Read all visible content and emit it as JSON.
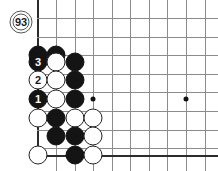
{
  "app": {
    "title": "Go Board Diagram",
    "board_type": "go-goban-corner-diagram"
  },
  "board": {
    "background_color": "#ffffff",
    "line_color": "#8c8c8c",
    "edge_color": "#2b2b2b",
    "black_color": "#141414",
    "white_color": "#ffffff",
    "cell_size": 18.6,
    "origin_x": 38,
    "origin_y": 18,
    "columns_x": [
      38,
      56,
      75,
      93,
      112,
      130,
      149,
      167,
      186,
      205
    ],
    "rows_y": [
      18,
      37,
      55,
      74,
      92,
      111,
      130,
      148
    ],
    "left_edge_x": 38,
    "bottom_edge_y": 155,
    "star_points": [
      {
        "name": "hoshi-left",
        "x": 93,
        "y": 99
      },
      {
        "name": "hoshi-right",
        "x": 186,
        "y": 99
      }
    ]
  },
  "move_marker": {
    "label": "93",
    "x": 21,
    "y": 22,
    "description": "move-number-marker"
  },
  "stones": [
    {
      "color": "black",
      "x": 38,
      "y": 55,
      "label": ""
    },
    {
      "color": "black",
      "x": 56,
      "y": 55,
      "label": ""
    },
    {
      "color": "black",
      "x": 38,
      "y": 62,
      "label": "3"
    },
    {
      "color": "white",
      "x": 56,
      "y": 62,
      "label": ""
    },
    {
      "color": "black",
      "x": 75,
      "y": 62,
      "label": ""
    },
    {
      "color": "white",
      "x": 38,
      "y": 80,
      "label": "2"
    },
    {
      "color": "white",
      "x": 56,
      "y": 80,
      "label": ""
    },
    {
      "color": "black",
      "x": 75,
      "y": 80,
      "label": ""
    },
    {
      "color": "black",
      "x": 38,
      "y": 99,
      "label": "1"
    },
    {
      "color": "white",
      "x": 56,
      "y": 99,
      "label": ""
    },
    {
      "color": "black",
      "x": 75,
      "y": 99,
      "label": ""
    },
    {
      "color": "white",
      "x": 38,
      "y": 118,
      "label": ""
    },
    {
      "color": "black",
      "x": 56,
      "y": 118,
      "label": ""
    },
    {
      "color": "white",
      "x": 75,
      "y": 118,
      "label": ""
    },
    {
      "color": "white",
      "x": 93,
      "y": 118,
      "label": ""
    },
    {
      "color": "black",
      "x": 56,
      "y": 136,
      "label": ""
    },
    {
      "color": "black",
      "x": 75,
      "y": 136,
      "label": ""
    },
    {
      "color": "white",
      "x": 93,
      "y": 136,
      "label": ""
    },
    {
      "color": "white",
      "x": 38,
      "y": 155,
      "label": ""
    },
    {
      "color": "black",
      "x": 75,
      "y": 155,
      "label": ""
    },
    {
      "color": "white",
      "x": 93,
      "y": 155,
      "label": ""
    }
  ]
}
